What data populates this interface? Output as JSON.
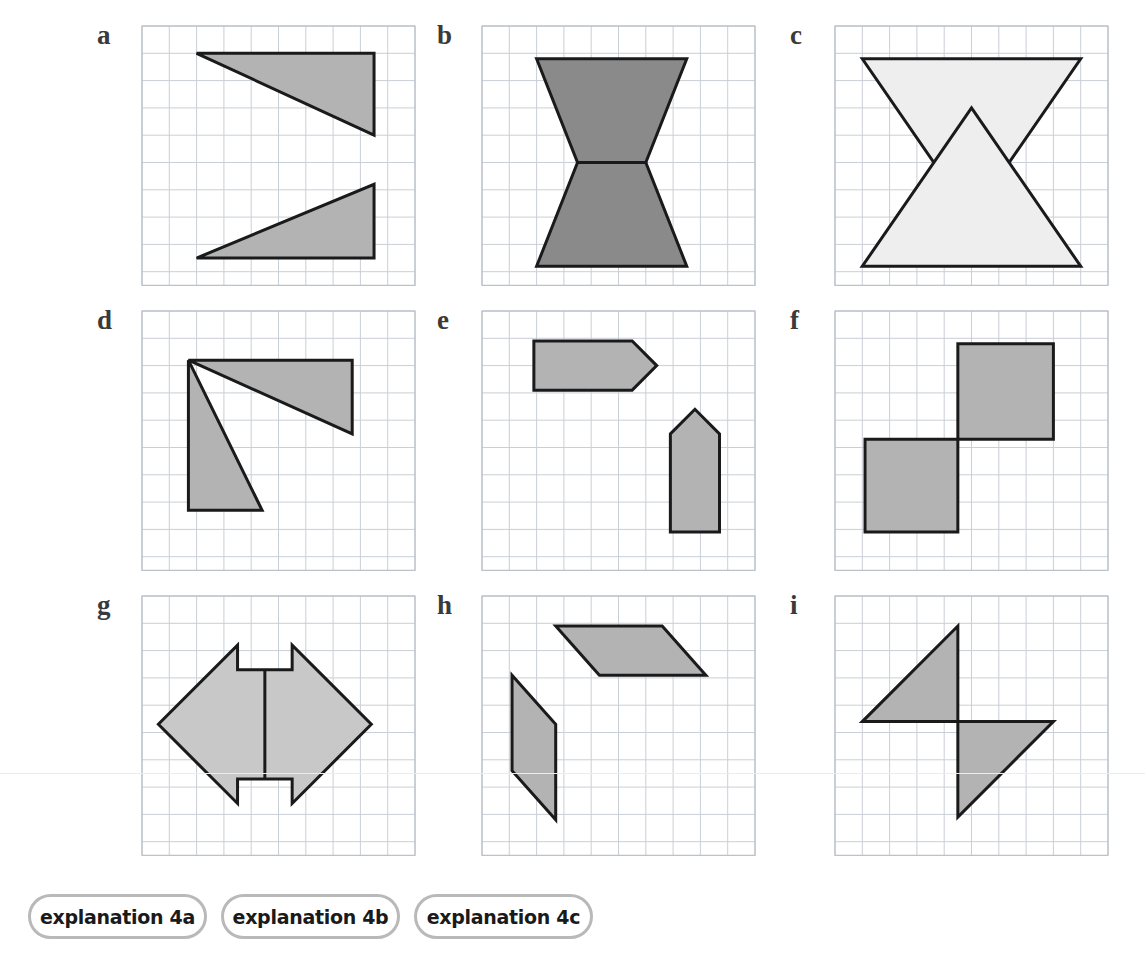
{
  "page": {
    "width": 1145,
    "height": 970,
    "background": "#ffffff"
  },
  "style": {
    "grid_line_color": "#c9cfd6",
    "grid_border_color": "#b8bfc7",
    "shape_stroke_color": "#1a1a1a",
    "fill_medium_gray": "#b3b3b3",
    "fill_dark_gray": "#8a8a8a",
    "fill_light_gray": "#eeeeee",
    "label_color": "#3a3a3a",
    "pill_border_color": "#b9b9b9",
    "divider_color": "#b6b6b6"
  },
  "footer": {
    "buttons": [
      {
        "label": "explanation 4a",
        "left": 28,
        "width": 179
      },
      {
        "label": "explanation 4b",
        "left": 221,
        "width": 179
      },
      {
        "label": "explanation 4c",
        "left": 414,
        "width": 179
      }
    ],
    "divider_label": "divider-bar"
  },
  "panels": [
    {
      "id": "a",
      "label": "a",
      "label_x": 97,
      "label_y": 22,
      "grid_x": 141,
      "grid_y": 25,
      "cell": 27.3,
      "cols": 10,
      "rows": 9.5,
      "shapes": [
        {
          "name": "triangle-upper-right",
          "type": "polygon",
          "fill": "#b3b3b3",
          "points_cells": [
            [
              2,
              1
            ],
            [
              8.5,
              1
            ],
            [
              8.5,
              4
            ]
          ]
        },
        {
          "name": "triangle-lower-right",
          "type": "polygon",
          "fill": "#b3b3b3",
          "points_cells": [
            [
              2,
              8.5
            ],
            [
              8.5,
              5.8
            ],
            [
              8.5,
              8.5
            ]
          ]
        }
      ],
      "lines": []
    },
    {
      "id": "b",
      "label": "b",
      "label_x": 437,
      "label_y": 22,
      "grid_x": 481,
      "grid_y": 25,
      "cell": 27.3,
      "cols": 10,
      "rows": 9.5,
      "shapes": [
        {
          "name": "trapezoid-top",
          "type": "polygon",
          "fill": "#8a8a8a",
          "points_cells": [
            [
              2,
              1.2
            ],
            [
              7.5,
              1.2
            ],
            [
              6,
              5
            ],
            [
              3.5,
              5
            ]
          ]
        },
        {
          "name": "trapezoid-bottom",
          "type": "polygon",
          "fill": "#8a8a8a",
          "points_cells": [
            [
              3.5,
              5
            ],
            [
              6,
              5
            ],
            [
              7.5,
              8.8
            ],
            [
              2,
              8.8
            ]
          ]
        }
      ],
      "lines": []
    },
    {
      "id": "c",
      "label": "c",
      "label_x": 790,
      "label_y": 22,
      "grid_x": 834,
      "grid_y": 25,
      "cell": 27.3,
      "cols": 10,
      "rows": 9.5,
      "shapes": [
        {
          "name": "triangle-pointing-down",
          "type": "polygon",
          "fill": "#eeeeee",
          "points_cells": [
            [
              1,
              1.2
            ],
            [
              9,
              1.2
            ],
            [
              5,
              7
            ]
          ]
        },
        {
          "name": "triangle-pointing-up",
          "type": "polygon",
          "fill": "#eeeeee",
          "points_cells": [
            [
              5,
              3
            ],
            [
              9,
              8.8
            ],
            [
              1,
              8.8
            ]
          ]
        }
      ],
      "lines": []
    },
    {
      "id": "d",
      "label": "d",
      "label_x": 97,
      "label_y": 307,
      "grid_x": 141,
      "grid_y": 310,
      "cell": 27.3,
      "cols": 10,
      "rows": 9.5,
      "shapes": [
        {
          "name": "triangle-top-right",
          "type": "polygon",
          "fill": "#b3b3b3",
          "points_cells": [
            [
              1.7,
              1.8
            ],
            [
              7.7,
              1.8
            ],
            [
              7.7,
              4.5
            ]
          ]
        },
        {
          "name": "triangle-lower-left",
          "type": "polygon",
          "fill": "#b3b3b3",
          "points_cells": [
            [
              1.7,
              1.8
            ],
            [
              4.4,
              7.3
            ],
            [
              1.7,
              7.3
            ]
          ]
        }
      ],
      "lines": []
    },
    {
      "id": "e",
      "label": "e",
      "label_x": 437,
      "label_y": 307,
      "grid_x": 481,
      "grid_y": 310,
      "cell": 27.3,
      "cols": 10,
      "rows": 9.5,
      "shapes": [
        {
          "name": "pentagon-arrow-horizontal",
          "type": "polygon",
          "fill": "#b3b3b3",
          "points_cells": [
            [
              1.9,
              1.1
            ],
            [
              5.5,
              1.1
            ],
            [
              6.4,
              2
            ],
            [
              5.5,
              2.9
            ],
            [
              1.9,
              2.9
            ]
          ]
        },
        {
          "name": "pentagon-arrow-vertical",
          "type": "polygon",
          "fill": "#b3b3b3",
          "points_cells": [
            [
              6.9,
              4.5
            ],
            [
              7.8,
              3.6
            ],
            [
              8.7,
              4.5
            ],
            [
              8.7,
              8.1
            ],
            [
              6.9,
              8.1
            ]
          ]
        }
      ],
      "lines": []
    },
    {
      "id": "f",
      "label": "f",
      "label_x": 790,
      "label_y": 307,
      "grid_x": 834,
      "grid_y": 310,
      "cell": 27.3,
      "cols": 10,
      "rows": 9.5,
      "shapes": [
        {
          "name": "square-upper-right",
          "type": "polygon",
          "fill": "#b3b3b3",
          "points_cells": [
            [
              4.5,
              1.2
            ],
            [
              8,
              1.2
            ],
            [
              8,
              4.7
            ],
            [
              4.5,
              4.7
            ]
          ]
        },
        {
          "name": "square-lower-left",
          "type": "polygon",
          "fill": "#b3b3b3",
          "points_cells": [
            [
              1.1,
              4.7
            ],
            [
              4.5,
              4.7
            ],
            [
              4.5,
              8.1
            ],
            [
              1.1,
              8.1
            ]
          ]
        }
      ],
      "lines": []
    },
    {
      "id": "g",
      "label": "g",
      "label_x": 97,
      "label_y": 592,
      "grid_x": 141,
      "grid_y": 595,
      "cell": 27.3,
      "cols": 10,
      "rows": 9.5,
      "shapes": [
        {
          "name": "notched-diamond",
          "type": "polygon",
          "fill": "#c8c8c8",
          "points_cells": [
            [
              3.5,
              1.8
            ],
            [
              3.5,
              2.7
            ],
            [
              5.5,
              2.7
            ],
            [
              5.5,
              1.8
            ],
            [
              8.4,
              4.7
            ],
            [
              5.5,
              7.6
            ],
            [
              5.5,
              6.7
            ],
            [
              3.5,
              6.7
            ],
            [
              3.5,
              7.6
            ],
            [
              0.6,
              4.7
            ]
          ]
        }
      ],
      "lines": [
        {
          "name": "center-vertical-line",
          "from_cell": [
            4.5,
            2.7
          ],
          "to_cell": [
            4.5,
            6.7
          ]
        }
      ]
    },
    {
      "id": "h",
      "label": "h",
      "label_x": 437,
      "label_y": 592,
      "grid_x": 481,
      "grid_y": 595,
      "cell": 27.3,
      "cols": 10,
      "rows": 9.5,
      "shapes": [
        {
          "name": "parallelogram-upper-right",
          "type": "polygon",
          "fill": "#b3b3b3",
          "points_cells": [
            [
              2.7,
              1.1
            ],
            [
              6.6,
              1.1
            ],
            [
              8.2,
              2.9
            ],
            [
              4.3,
              2.9
            ]
          ]
        },
        {
          "name": "parallelogram-lower-left",
          "type": "polygon",
          "fill": "#b3b3b3",
          "points_cells": [
            [
              1.1,
              2.9
            ],
            [
              2.7,
              4.7
            ],
            [
              2.7,
              8.2
            ],
            [
              1.1,
              6.4
            ]
          ]
        }
      ],
      "lines": []
    },
    {
      "id": "i",
      "label": "i",
      "label_x": 790,
      "label_y": 592,
      "grid_x": 834,
      "grid_y": 595,
      "cell": 27.3,
      "cols": 10,
      "rows": 9.5,
      "shapes": [
        {
          "name": "triangle-upper-left",
          "type": "polygon",
          "fill": "#b3b3b3",
          "points_cells": [
            [
              4.5,
              1.1
            ],
            [
              4.5,
              4.6
            ],
            [
              1.0,
              4.6
            ]
          ]
        },
        {
          "name": "triangle-lower-right",
          "type": "polygon",
          "fill": "#b3b3b3",
          "points_cells": [
            [
              4.5,
              4.6
            ],
            [
              8.0,
              4.6
            ],
            [
              4.5,
              8.1
            ]
          ]
        }
      ],
      "lines": []
    }
  ]
}
